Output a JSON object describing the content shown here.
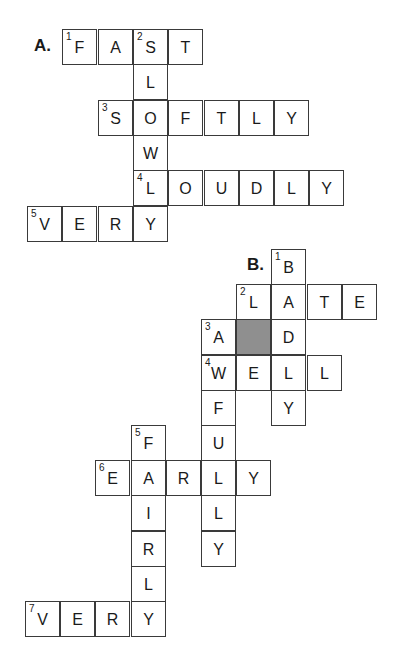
{
  "puzzles": [
    {
      "label": "A.",
      "label_pos": [
        34,
        36
      ],
      "origin": [
        27,
        29
      ],
      "pitch": 35.3,
      "words": [
        {
          "num": "1",
          "answer": "FAST",
          "dir": "across",
          "row": 0,
          "col": 1
        },
        {
          "num": "2",
          "answer": "SLOWLY",
          "dir": "down",
          "row": 0,
          "col": 3
        },
        {
          "num": "3",
          "answer": "SOFTLY",
          "dir": "across",
          "row": 2,
          "col": 2
        },
        {
          "num": "4",
          "answer": "LOUDLY",
          "dir": "across",
          "row": 4,
          "col": 3
        },
        {
          "num": "5",
          "answer": "VERY",
          "dir": "across",
          "row": 5,
          "col": 0
        }
      ],
      "shaded": []
    },
    {
      "label": "B.",
      "label_pos": [
        247,
        255
      ],
      "origin": [
        25,
        249
      ],
      "pitch": 35.2,
      "words": [
        {
          "num": "1",
          "answer": "BADLY",
          "dir": "down",
          "row": 0,
          "col": 7
        },
        {
          "num": "2",
          "answer": "LATE",
          "dir": "across",
          "row": 1,
          "col": 6
        },
        {
          "num": "3",
          "answer": "AWFULLY",
          "dir": "down",
          "row": 2,
          "col": 5
        },
        {
          "num": "4",
          "answer": "WELL",
          "dir": "across",
          "row": 3,
          "col": 5
        },
        {
          "num": "5",
          "answer": "FAIRLY",
          "dir": "down",
          "row": 5,
          "col": 3
        },
        {
          "num": "6",
          "answer": "EARLY",
          "dir": "across",
          "row": 6,
          "col": 2
        },
        {
          "num": "7",
          "answer": "VERY",
          "dir": "across",
          "row": 10,
          "col": 0
        }
      ],
      "shaded": [
        [
          2,
          6
        ]
      ]
    }
  ]
}
